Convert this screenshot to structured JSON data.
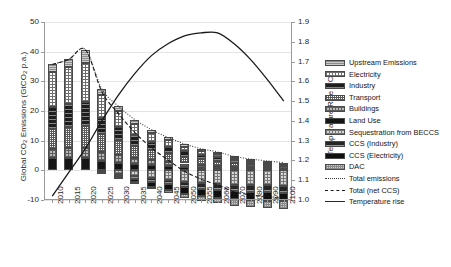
{
  "chart_data": {
    "type": "bar",
    "title": "",
    "xlabel": "",
    "ylabel": "Global CO2 Emissions (GtCO2 p.a.)",
    "ylabel_secondary": "Temperature Rise (°C)",
    "categories": [
      "2010",
      "2015",
      "2020",
      "2025",
      "2030",
      "2035",
      "2040",
      "2045",
      "2050",
      "2055",
      "2060",
      "2070",
      "2080",
      "2090",
      "2100"
    ],
    "ylim": [
      -10,
      50
    ],
    "yticks": [
      -10,
      0,
      10,
      20,
      30,
      40,
      50
    ],
    "ylim_secondary": [
      1.0,
      1.9
    ],
    "yticks_secondary": [
      1.0,
      1.1,
      1.2,
      1.3,
      1.4,
      1.5,
      1.6,
      1.7,
      1.8,
      1.9
    ],
    "grid": true,
    "legend_position": "right",
    "series": [
      {
        "name": "Land Use",
        "pattern": "p-landuse",
        "sign": "positive",
        "values": [
          4.0,
          4.0,
          4.0,
          3.2,
          2.6,
          2.1,
          1.7,
          1.4,
          1.1,
          0.9,
          0.7,
          0.5,
          0.4,
          0.3,
          0.2
        ]
      },
      {
        "name": "Buildings",
        "pattern": "p-buildings",
        "sign": "positive",
        "values": [
          3.2,
          3.4,
          3.5,
          2.9,
          2.5,
          2.1,
          1.8,
          1.5,
          1.2,
          1.0,
          0.9,
          0.7,
          0.6,
          0.5,
          0.4
        ]
      },
      {
        "name": "Transport",
        "pattern": "p-transport",
        "sign": "positive",
        "values": [
          6.8,
          7.2,
          7.6,
          6.0,
          5.0,
          4.1,
          3.4,
          2.8,
          2.3,
          1.9,
          1.6,
          1.2,
          1.0,
          0.8,
          0.7
        ]
      },
      {
        "name": "Industry",
        "pattern": "p-industry",
        "sign": "positive",
        "values": [
          7.2,
          7.6,
          8.0,
          5.6,
          4.4,
          3.5,
          2.8,
          2.3,
          1.8,
          1.5,
          1.3,
          1.0,
          0.8,
          0.7,
          0.6
        ]
      },
      {
        "name": "Electricity",
        "pattern": "p-electricity",
        "sign": "positive",
        "values": [
          12.0,
          12.6,
          13.2,
          7.6,
          5.4,
          3.9,
          2.8,
          2.1,
          1.6,
          1.2,
          1.0,
          0.7,
          0.5,
          0.4,
          0.3
        ]
      },
      {
        "name": "Upstream Emissions",
        "pattern": "p-upstream",
        "sign": "positive",
        "values": [
          2.5,
          2.6,
          4.4,
          2.1,
          1.7,
          1.4,
          1.2,
          1.0,
          0.9,
          0.8,
          0.7,
          0.6,
          0.5,
          0.5,
          0.4
        ]
      },
      {
        "name": "Sequestration from BECCS",
        "pattern": "p-beccs",
        "sign": "negative",
        "values": [
          0.0,
          0.0,
          0.0,
          -0.4,
          -1.1,
          -1.9,
          -2.6,
          -3.2,
          -3.8,
          -4.2,
          -4.5,
          -4.8,
          -5.0,
          -5.1,
          -5.2
        ]
      },
      {
        "name": "CCS (Industry)",
        "pattern": "p-ccsind",
        "sign": "negative",
        "values": [
          0.0,
          0.0,
          0.0,
          -0.2,
          -0.5,
          -0.9,
          -1.2,
          -1.5,
          -1.8,
          -2.0,
          -2.1,
          -2.2,
          -2.3,
          -2.3,
          -2.4
        ]
      },
      {
        "name": "CCS (Electricity)",
        "pattern": "p-ccselec",
        "sign": "negative",
        "values": [
          0.0,
          0.0,
          0.0,
          -0.3,
          -0.8,
          -1.3,
          -1.7,
          -2.0,
          -2.3,
          -2.5,
          -2.6,
          -2.7,
          -2.8,
          -2.8,
          -2.9
        ]
      },
      {
        "name": "DAC",
        "pattern": "p-dac",
        "sign": "negative",
        "values": [
          0.0,
          0.0,
          0.0,
          0.0,
          -0.1,
          -0.3,
          -0.6,
          -0.9,
          -1.3,
          -1.6,
          -1.9,
          -2.2,
          -2.4,
          -2.5,
          -2.6
        ]
      }
    ],
    "lines": [
      {
        "name": "Total emissions",
        "style": "dotted",
        "axis": "left",
        "values": [
          35.7,
          37.4,
          40.7,
          27.4,
          21.6,
          17.1,
          13.7,
          11.1,
          8.9,
          7.3,
          6.2,
          4.7,
          3.8,
          3.2,
          2.6
        ]
      },
      {
        "name": "Total (net CCS)",
        "style": "dashed",
        "axis": "left",
        "values": [
          35.7,
          37.4,
          40.7,
          26.5,
          19.1,
          12.7,
          7.6,
          3.5,
          -0.3,
          -3.0,
          -4.9,
          -7.2,
          -8.3,
          -8.9,
          -9.5
        ]
      },
      {
        "name": "Temperature rise",
        "style": "solid",
        "axis": "right",
        "values": [
          1.02,
          1.14,
          1.26,
          1.4,
          1.53,
          1.64,
          1.73,
          1.79,
          1.83,
          1.845,
          1.845,
          1.79,
          1.71,
          1.61,
          1.5
        ]
      }
    ]
  },
  "legend": {
    "items": [
      {
        "label": "Upstream Emissions",
        "kind": "swatch",
        "pattern": "p-upstream"
      },
      {
        "label": "Electricity",
        "kind": "swatch",
        "pattern": "p-electricity"
      },
      {
        "label": "Industry",
        "kind": "swatch",
        "pattern": "p-industry"
      },
      {
        "label": "Transport",
        "kind": "swatch",
        "pattern": "p-transport"
      },
      {
        "label": "Buildings",
        "kind": "swatch",
        "pattern": "p-buildings"
      },
      {
        "label": "Land Use",
        "kind": "swatch",
        "pattern": "p-landuse"
      },
      {
        "label": "Sequestration from BECCS",
        "kind": "swatch",
        "pattern": "p-beccs"
      },
      {
        "label": "CCS (Industry)",
        "kind": "swatch",
        "pattern": "p-ccsind"
      },
      {
        "label": "CCS (Electricity)",
        "kind": "swatch",
        "pattern": "p-ccselec"
      },
      {
        "label": "DAC",
        "kind": "swatch",
        "pattern": "p-dac"
      },
      {
        "label": "Total emissions",
        "kind": "line",
        "pattern": "ln-dot"
      },
      {
        "label": "Total (net CCS)",
        "kind": "line",
        "pattern": "ln-dash"
      },
      {
        "label": "Temperature rise",
        "kind": "line",
        "pattern": "ln-solid"
      }
    ]
  },
  "axes": {
    "left_title_main": "Global CO",
    "left_title_sub1": "2",
    "left_title_mid": " Emissions (GtCO",
    "left_title_sub2": "2",
    "left_title_end": " p.a.)",
    "right_title": "Temperature Rise (°C)"
  }
}
